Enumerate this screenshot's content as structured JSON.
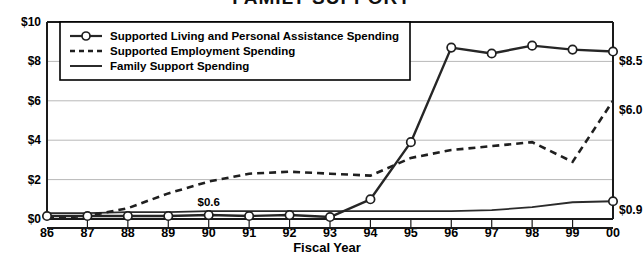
{
  "chart_data": {
    "type": "line",
    "title": "FAMILY SUPPORT",
    "xlabel": "Fiscal Year",
    "ylabel": "",
    "categories": [
      "86",
      "87",
      "88",
      "89",
      "90",
      "91",
      "92",
      "93",
      "94",
      "95",
      "96",
      "97",
      "98",
      "99",
      "00"
    ],
    "ylim": [
      0,
      10
    ],
    "yticks": [
      "$0",
      "$2",
      "$4",
      "$6",
      "$8",
      "$10"
    ],
    "ytick_values": [
      0,
      2,
      4,
      6,
      8,
      10
    ],
    "grid": true,
    "legend_position": "top-left",
    "series": [
      {
        "name": "Supported Living and Personal Assistance Spending",
        "style": "solid-markers",
        "values": [
          0.15,
          0.15,
          0.15,
          0.15,
          0.2,
          0.15,
          0.2,
          0.1,
          1.0,
          3.9,
          8.7,
          8.4,
          8.8,
          8.6,
          8.5
        ]
      },
      {
        "name": "Supported Employment Spending",
        "style": "dashed",
        "values": [
          0.05,
          0.15,
          0.55,
          1.3,
          1.9,
          2.3,
          2.4,
          2.3,
          2.2,
          3.1,
          3.5,
          3.7,
          3.9,
          2.9,
          6.0
        ]
      },
      {
        "name": "Family Support Spending",
        "style": "solid-thin",
        "values": [
          0.3,
          0.3,
          0.35,
          0.35,
          0.4,
          0.4,
          0.4,
          0.4,
          0.4,
          0.4,
          0.4,
          0.45,
          0.6,
          0.85,
          0.9
        ]
      }
    ],
    "point_labels": [
      {
        "series": "Supported Employment Spending",
        "category": "90",
        "text": "$0.6"
      },
      {
        "series": "Supported Living and Personal Assistance Spending",
        "category": "00",
        "text": "$8.5"
      },
      {
        "series": "Supported Employment Spending",
        "category": "00",
        "text": "$6.0"
      },
      {
        "series": "Family Support Spending",
        "category": "00",
        "text": "$0.9"
      }
    ],
    "end_labels": [
      {
        "text": "$8.5",
        "value": 8.5
      },
      {
        "text": "$6.0",
        "value": 6.0
      },
      {
        "text": "$0.9",
        "value": 0.9
      }
    ]
  },
  "legend": {
    "items": [
      {
        "label": "Supported Living and Personal Assistance Spending",
        "marker": "line-with-circle"
      },
      {
        "label": "Supported Employment Spending",
        "marker": "dashed-line"
      },
      {
        "label": "Family Support Spending",
        "marker": "solid-line"
      }
    ]
  },
  "axis": {
    "x_title": "Fiscal Year",
    "y_ticks": [
      "$10",
      "$8",
      "$6",
      "$4",
      "$2",
      "$0"
    ],
    "x_ticks": [
      "86",
      "87",
      "88",
      "89",
      "90",
      "91",
      "92",
      "93",
      "94",
      "95",
      "96",
      "97",
      "98",
      "99",
      "00"
    ]
  },
  "labels": {
    "mid_label": "$0.6",
    "end_sl": "$8.5",
    "end_se": "$6.0",
    "end_fs": "$0.9"
  }
}
